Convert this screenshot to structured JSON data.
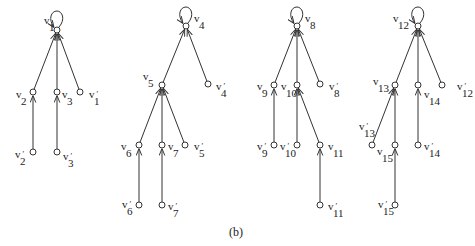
{
  "caption": "(b)",
  "style": {
    "stroke": "#333333",
    "node_fill": "#ffffff",
    "node_radius": 3
  },
  "trees": [
    {
      "name": "tree-1",
      "root": "v1",
      "nodes": [
        {
          "id": "v1",
          "base": "v",
          "sub": "1",
          "prime": false,
          "x": 57,
          "y": 30,
          "lx": 44,
          "ly": 24,
          "loop": true
        },
        {
          "id": "v2",
          "base": "v",
          "sub": "2",
          "prime": false,
          "x": 33,
          "y": 92,
          "lx": 16,
          "ly": 98
        },
        {
          "id": "v3",
          "base": "v",
          "sub": "3",
          "prime": false,
          "x": 57,
          "y": 92,
          "lx": 62,
          "ly": 98
        },
        {
          "id": "v1p",
          "base": "v",
          "sub": "1",
          "prime": true,
          "x": 80,
          "y": 92,
          "lx": 89,
          "ly": 98
        },
        {
          "id": "v2p",
          "base": "v",
          "sub": "2",
          "prime": true,
          "x": 33,
          "y": 152,
          "lx": 15,
          "ly": 158
        },
        {
          "id": "v3p",
          "base": "v",
          "sub": "3",
          "prime": true,
          "x": 57,
          "y": 152,
          "lx": 63,
          "ly": 160
        }
      ],
      "edges": [
        [
          "v2",
          "v1"
        ],
        [
          "v3",
          "v1"
        ],
        [
          "v1p",
          "v1"
        ],
        [
          "v2p",
          "v2"
        ],
        [
          "v3p",
          "v3"
        ]
      ]
    },
    {
      "name": "tree-2",
      "root": "v4",
      "nodes": [
        {
          "id": "v4",
          "base": "v",
          "sub": "4",
          "prime": false,
          "x": 186,
          "y": 26,
          "lx": 194,
          "ly": 22,
          "loop": true
        },
        {
          "id": "v5",
          "base": "v",
          "sub": "5",
          "prime": false,
          "x": 162,
          "y": 85,
          "lx": 143,
          "ly": 80
        },
        {
          "id": "v4p",
          "base": "v",
          "sub": "4",
          "prime": true,
          "x": 208,
          "y": 84,
          "lx": 216,
          "ly": 90
        },
        {
          "id": "v6",
          "base": "v",
          "sub": "6",
          "prime": false,
          "x": 139,
          "y": 145,
          "lx": 121,
          "ly": 150
        },
        {
          "id": "v7",
          "base": "v",
          "sub": "7",
          "prime": false,
          "x": 162,
          "y": 145,
          "lx": 168,
          "ly": 150
        },
        {
          "id": "v5p",
          "base": "v",
          "sub": "5",
          "prime": true,
          "x": 185,
          "y": 145,
          "lx": 194,
          "ly": 150
        },
        {
          "id": "v6p",
          "base": "v",
          "sub": "6",
          "prime": true,
          "x": 139,
          "y": 205,
          "lx": 122,
          "ly": 208
        },
        {
          "id": "v7p",
          "base": "v",
          "sub": "7",
          "prime": true,
          "x": 162,
          "y": 205,
          "lx": 168,
          "ly": 210
        }
      ],
      "edges": [
        [
          "v5",
          "v4"
        ],
        [
          "v4p",
          "v4"
        ],
        [
          "v6",
          "v5"
        ],
        [
          "v7",
          "v5"
        ],
        [
          "v5p",
          "v5"
        ],
        [
          "v6p",
          "v6"
        ],
        [
          "v7p",
          "v7"
        ]
      ]
    },
    {
      "name": "tree-3",
      "root": "v8",
      "nodes": [
        {
          "id": "v8",
          "base": "v",
          "sub": "8",
          "prime": false,
          "x": 297,
          "y": 26,
          "lx": 305,
          "ly": 22,
          "loop": true
        },
        {
          "id": "v9",
          "base": "v",
          "sub": "9",
          "prime": false,
          "x": 274,
          "y": 85,
          "lx": 257,
          "ly": 90
        },
        {
          "id": "v10",
          "base": "v",
          "sub": "10",
          "prime": false,
          "x": 297,
          "y": 85,
          "lx": 281,
          "ly": 90
        },
        {
          "id": "v8p",
          "base": "v",
          "sub": "8",
          "prime": true,
          "x": 320,
          "y": 84,
          "lx": 329,
          "ly": 90
        },
        {
          "id": "v9p",
          "base": "v",
          "sub": "9",
          "prime": true,
          "x": 274,
          "y": 145,
          "lx": 257,
          "ly": 150
        },
        {
          "id": "v10p",
          "base": "v",
          "sub": "10",
          "prime": true,
          "x": 297,
          "y": 145,
          "lx": 280,
          "ly": 150
        },
        {
          "id": "v11",
          "base": "v",
          "sub": "11",
          "prime": false,
          "x": 320,
          "y": 145,
          "lx": 328,
          "ly": 150
        },
        {
          "id": "v11p",
          "base": "v",
          "sub": "11",
          "prime": true,
          "x": 320,
          "y": 205,
          "lx": 328,
          "ly": 210
        }
      ],
      "edges": [
        [
          "v9",
          "v8"
        ],
        [
          "v10",
          "v8"
        ],
        [
          "v8p",
          "v8"
        ],
        [
          "v9p",
          "v9"
        ],
        [
          "v10p",
          "v10"
        ],
        [
          "v11",
          "v10"
        ],
        [
          "v11p",
          "v11"
        ]
      ]
    },
    {
      "name": "tree-4",
      "root": "v12",
      "nodes": [
        {
          "id": "v12",
          "base": "v",
          "sub": "12",
          "prime": false,
          "x": 418,
          "y": 26,
          "lx": 393,
          "ly": 22,
          "loop": true
        },
        {
          "id": "v13",
          "base": "v",
          "sub": "13",
          "prime": false,
          "x": 395,
          "y": 85,
          "lx": 373,
          "ly": 85
        },
        {
          "id": "v14",
          "base": "v",
          "sub": "14",
          "prime": false,
          "x": 418,
          "y": 85,
          "lx": 424,
          "ly": 98
        },
        {
          "id": "v12p",
          "base": "v",
          "sub": "12",
          "prime": true,
          "x": 442,
          "y": 85,
          "lx": 457,
          "ly": 90
        },
        {
          "id": "v13p",
          "base": "v",
          "sub": "13",
          "prime": true,
          "x": 372,
          "y": 145,
          "lx": 359,
          "ly": 130
        },
        {
          "id": "v15",
          "base": "v",
          "sub": "15",
          "prime": false,
          "x": 395,
          "y": 145,
          "lx": 377,
          "ly": 155
        },
        {
          "id": "v14p",
          "base": "v",
          "sub": "14",
          "prime": true,
          "x": 418,
          "y": 145,
          "lx": 424,
          "ly": 150
        },
        {
          "id": "v15p",
          "base": "v",
          "sub": "15",
          "prime": true,
          "x": 395,
          "y": 205,
          "lx": 378,
          "ly": 208
        }
      ],
      "edges": [
        [
          "v13",
          "v12"
        ],
        [
          "v14",
          "v12"
        ],
        [
          "v12p",
          "v12"
        ],
        [
          "v13p",
          "v13"
        ],
        [
          "v15",
          "v13"
        ],
        [
          "v14p",
          "v14"
        ],
        [
          "v15p",
          "v15"
        ]
      ]
    }
  ]
}
